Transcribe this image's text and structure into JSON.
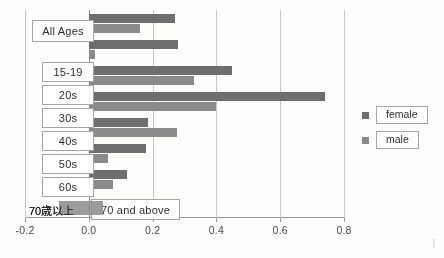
{
  "chart_data": {
    "type": "bar",
    "orientation": "horizontal",
    "title": "",
    "xlabel": "",
    "ylabel": "",
    "xlim": [
      -0.2,
      0.8
    ],
    "xticks": [
      "-0.2",
      "0.0",
      "0.2",
      "0.4",
      "0.6",
      "0.8"
    ],
    "xtick_values": [
      -0.2,
      0.0,
      0.2,
      0.4,
      0.6,
      0.8
    ],
    "grid": true,
    "legend_position": "right",
    "categories": [
      "All Ages",
      "15-19",
      "20s",
      "30s",
      "40s",
      "50s",
      "60s",
      "70 and above"
    ],
    "series": [
      {
        "name": "female",
        "color": "#6e6e6e",
        "values": [
          0.27,
          0.28,
          0.45,
          0.74,
          0.185,
          0.18,
          0.12,
          0.0
        ]
      },
      {
        "name": "male",
        "color": "#8a8a8a",
        "values": [
          0.16,
          0.02,
          0.33,
          0.4,
          0.275,
          0.06,
          0.075,
          0.0
        ]
      }
    ],
    "original_axis_label_jp": "70歳以上"
  },
  "legend": {
    "items": [
      {
        "label": "female",
        "swatch": "female-swatch"
      },
      {
        "label": "male",
        "swatch": "male-swatch"
      }
    ]
  },
  "callouts": [
    {
      "label": "All Ages",
      "left": 32,
      "top": 20,
      "width": 62,
      "height": 22
    },
    {
      "label": "15-19",
      "left": 42,
      "top": 62,
      "width": 52,
      "height": 20
    },
    {
      "label": "20s",
      "left": 42,
      "top": 85,
      "width": 52,
      "height": 20
    },
    {
      "label": "30s",
      "left": 42,
      "top": 108,
      "width": 52,
      "height": 20
    },
    {
      "label": "40s",
      "left": 42,
      "top": 131,
      "width": 52,
      "height": 20
    },
    {
      "label": "50s",
      "left": 42,
      "top": 154,
      "width": 52,
      "height": 20
    },
    {
      "label": "60s",
      "left": 42,
      "top": 177,
      "width": 52,
      "height": 20
    },
    {
      "label": "70  and above",
      "left": 91,
      "top": 199,
      "width": 89,
      "height": 21
    }
  ],
  "jp_axis_label": {
    "text": "70歳以上",
    "left": 29,
    "top": 202
  },
  "corner_mark": "|"
}
